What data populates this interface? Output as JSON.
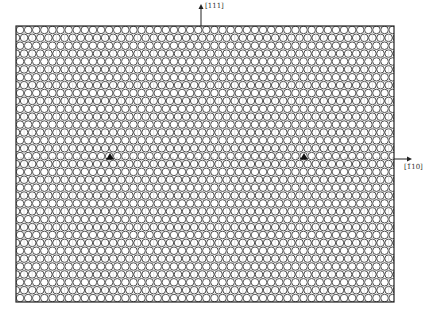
{
  "figure": {
    "type": "crystal-lattice-diagram",
    "box": {
      "x": 16,
      "y": 26,
      "width": 378,
      "height": 276
    },
    "lattice": {
      "cell_pitch_x": 8.1,
      "row_pitch_y": 7.9,
      "circle_radius": 3.8,
      "stroke_color": "#3a3a3a",
      "rows_above_fault": 17,
      "rows_below_fault": 18,
      "fault_row_y": 158
    },
    "axes": {
      "vertical": {
        "label": "[111]",
        "arrow_x": 201,
        "arrow_top_y": 4,
        "arrow_bottom_y": 26
      },
      "horizontal": {
        "label": "[1̄10]",
        "arrow_y": 159,
        "arrow_left_x": 394,
        "arrow_right_x": 412
      }
    },
    "dislocations": [
      {
        "symbol": "⊥",
        "x": 110,
        "y": 157
      },
      {
        "symbol": "⊥",
        "x": 304,
        "y": 157
      }
    ]
  }
}
